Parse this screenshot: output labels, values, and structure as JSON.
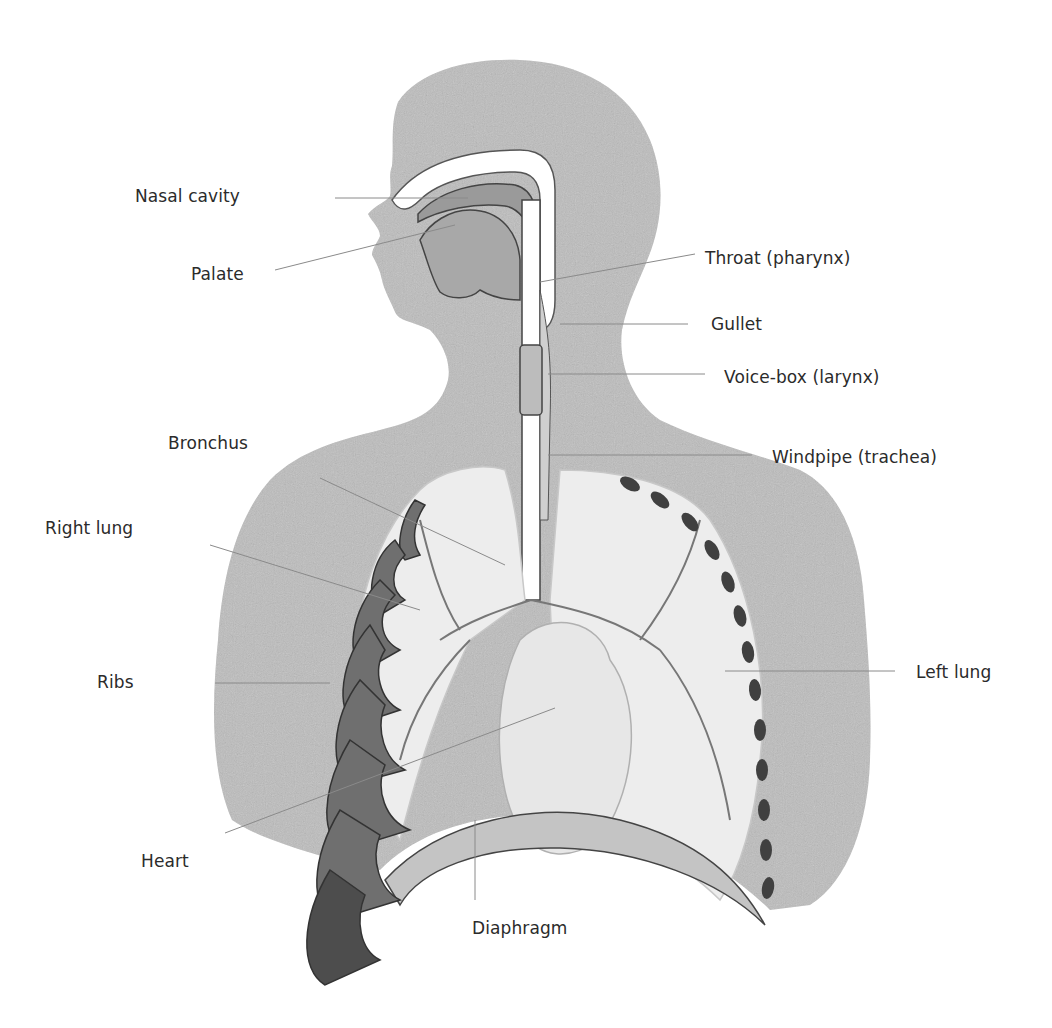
{
  "diagram": {
    "colors": {
      "background": "#ffffff",
      "body_wash": "#b9b9b9",
      "body_wash_light": "#d6d6d6",
      "lung_fill": "#eeeeee",
      "rib_fill": "#6d6d6d",
      "rib_dark": "#3f3f3f",
      "outline": "#555555",
      "leader_line": "#8a8a8a",
      "label_text": "#2b2b2b"
    },
    "labels": {
      "nasal_cavity": "Nasal cavity",
      "palate": "Palate",
      "throat": "Throat (pharynx)",
      "gullet": "Gullet",
      "voice_box": "Voice-box (larynx)",
      "windpipe": "Windpipe (trachea)",
      "bronchus": "Bronchus",
      "right_lung": "Right lung",
      "left_lung": "Left lung",
      "ribs": "Ribs",
      "heart": "Heart",
      "diaphragm": "Diaphragm"
    }
  }
}
